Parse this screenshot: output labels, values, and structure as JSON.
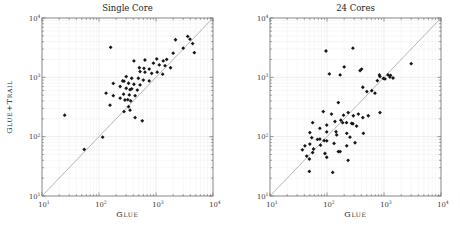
{
  "figure": {
    "background": "#ffffff",
    "marker_color": "#161616",
    "diagonal_color": "#a3a3a3",
    "frame_color": "#7a7a7a",
    "tick_color": "#6f6f6f",
    "grid_minor_color": "#efefef",
    "grid_major_color": "#e3e3e3",
    "tick_label_color": "#333333",
    "tick_label_base": "10"
  },
  "chart_data": [
    {
      "type": "scatter",
      "title": "Single Core",
      "xlabel": "Glue",
      "ylabel": "Glue+Trail",
      "x_scale": "log",
      "y_scale": "log",
      "xlim": [
        10,
        10000
      ],
      "ylim": [
        10,
        10000
      ],
      "tick_exponents": [
        1,
        2,
        3,
        4
      ],
      "grid": "both",
      "diagonal": true,
      "points": [
        [
          25,
          230
        ],
        [
          55,
          61
        ],
        [
          116,
          98
        ],
        [
          156,
          340
        ],
        [
          133,
          540
        ],
        [
          178,
          790
        ],
        [
          178,
          490
        ],
        [
          160,
          3200
        ],
        [
          235,
          445
        ],
        [
          235,
          700
        ],
        [
          260,
          870
        ],
        [
          270,
          520
        ],
        [
          275,
          265
        ],
        [
          275,
          860
        ],
        [
          285,
          415
        ],
        [
          300,
          655
        ],
        [
          300,
          1030
        ],
        [
          320,
          420
        ],
        [
          330,
          320
        ],
        [
          330,
          795
        ],
        [
          340,
          505
        ],
        [
          350,
          620
        ],
        [
          350,
          280
        ],
        [
          360,
          400
        ],
        [
          375,
          640
        ],
        [
          375,
          965
        ],
        [
          410,
          765
        ],
        [
          410,
          1890
        ],
        [
          430,
          210
        ],
        [
          430,
          490
        ],
        [
          470,
          610
        ],
        [
          490,
          965
        ],
        [
          510,
          1450
        ],
        [
          525,
          745
        ],
        [
          525,
          1250
        ],
        [
          575,
          185
        ],
        [
          600,
          900
        ],
        [
          615,
          1420
        ],
        [
          640,
          1220
        ],
        [
          640,
          1960
        ],
        [
          760,
          870
        ],
        [
          760,
          1380
        ],
        [
          840,
          1170
        ],
        [
          900,
          1730
        ],
        [
          1030,
          2040
        ],
        [
          1050,
          1220
        ],
        [
          1140,
          1620
        ],
        [
          1310,
          1130
        ],
        [
          1340,
          1890
        ],
        [
          1440,
          1570
        ],
        [
          1540,
          2000
        ],
        [
          1800,
          1450
        ],
        [
          2000,
          2550
        ],
        [
          2200,
          4300
        ],
        [
          3000,
          3100
        ],
        [
          3600,
          4900
        ],
        [
          3950,
          4400
        ],
        [
          4400,
          3700
        ],
        [
          4700,
          2600
        ]
      ]
    },
    {
      "type": "scatter",
      "title": "24 Cores",
      "xlabel": "Glue",
      "ylabel": "",
      "x_scale": "log",
      "y_scale": "log",
      "xlim": [
        10,
        10000
      ],
      "ylim": [
        10,
        10000
      ],
      "tick_exponents": [
        1,
        2,
        3,
        4
      ],
      "grid": "both",
      "diagonal": true,
      "points": [
        [
          96,
          2780
        ],
        [
          285,
          3100
        ],
        [
          200,
          1500
        ],
        [
          405,
          1380
        ],
        [
          380,
          1300
        ],
        [
          3000,
          1700
        ],
        [
          850,
          1030
        ],
        [
          1175,
          1100
        ],
        [
          1270,
          1010
        ],
        [
          1440,
          975
        ],
        [
          1040,
          940
        ],
        [
          765,
          880
        ],
        [
          830,
          1100
        ],
        [
          975,
          960
        ],
        [
          1300,
          1080
        ],
        [
          110,
          1140
        ],
        [
          170,
          1100
        ],
        [
          500,
          575
        ],
        [
          610,
          595
        ],
        [
          695,
          540
        ],
        [
          425,
          680
        ],
        [
          158,
          375
        ],
        [
          86,
          265
        ],
        [
          120,
          240
        ],
        [
          195,
          230
        ],
        [
          235,
          255
        ],
        [
          290,
          225
        ],
        [
          355,
          240
        ],
        [
          425,
          210
        ],
        [
          530,
          225
        ],
        [
          175,
          190
        ],
        [
          138,
          180
        ],
        [
          220,
          172
        ],
        [
          285,
          165
        ],
        [
          850,
          255
        ],
        [
          75,
          138
        ],
        [
          99,
          120
        ],
        [
          50,
          117
        ],
        [
          148,
          107
        ],
        [
          253,
          98
        ],
        [
          56,
          172
        ],
        [
          99,
          157
        ],
        [
          188,
          172
        ],
        [
          270,
          168
        ],
        [
          330,
          151
        ],
        [
          144,
          121
        ],
        [
          222,
          114
        ],
        [
          435,
          114
        ],
        [
          68,
          90
        ],
        [
          89,
          86
        ],
        [
          50,
          75
        ],
        [
          77,
          72
        ],
        [
          37,
          60
        ],
        [
          56,
          54
        ],
        [
          158,
          56
        ],
        [
          222,
          70
        ],
        [
          310,
          79
        ],
        [
          49,
          42
        ],
        [
          99,
          45
        ],
        [
          49,
          26
        ],
        [
          126,
          25
        ],
        [
          235,
          40
        ],
        [
          44,
          47
        ],
        [
          75,
          91
        ],
        [
          99,
          85
        ],
        [
          133,
          77
        ],
        [
          41,
          70
        ],
        [
          58,
          62
        ],
        [
          92,
          52
        ],
        [
          170,
          56
        ],
        [
          54,
          96
        ]
      ]
    }
  ]
}
